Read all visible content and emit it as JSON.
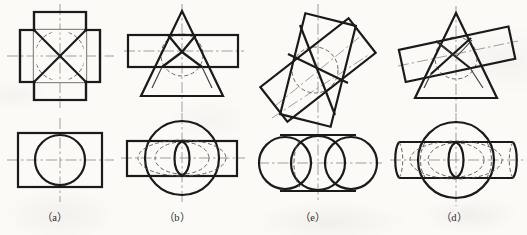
{
  "figure": {
    "kind": "engineering-drawing-plate",
    "background_color": "#fbfaf7",
    "line_color": "#1a1a1a",
    "hidden_line_color": "#4d4d4d",
    "center_line_color": "#8c8c8c",
    "outline_width_px": 2.2,
    "thin_width_px": 1.0,
    "labels": [
      {
        "id": "a",
        "text": "（a）",
        "x": 55,
        "y": 212
      },
      {
        "id": "b",
        "text": "（b）",
        "x": 175,
        "y": 212
      },
      {
        "id": "c",
        "text": "（e）",
        "x": 305,
        "y": 212
      },
      {
        "id": "d",
        "text": "（d）",
        "x": 448,
        "y": 212
      }
    ],
    "groups": [
      {
        "id": "a",
        "label": "（a）",
        "front_view": {
          "shape": "cross-shaped-outline",
          "note": "square prism crossed by a second square prism, with X diagonals and a hidden circle (cylinder) inscribed",
          "center": [
            60,
            55
          ],
          "half_core": 26,
          "arm": 14,
          "hidden_circle_radius": 25
        },
        "top_view": {
          "shape": "rectangle-with-circle",
          "center": [
            60,
            160
          ],
          "rect_half_width": 43,
          "rect_half_height": 27,
          "circle_radius": 25
        }
      },
      {
        "id": "b",
        "label": "（b）",
        "front_view": {
          "shape": "triangle-with-horizontal-rectangle",
          "note": "cone (triangle) penetrated by a horizontal cylinder (rectangle); hidden circle shows cylinder bore; intersection curves drawn",
          "apex": [
            182,
            12
          ],
          "base_left": [
            143,
            96
          ],
          "base_right": [
            222,
            96
          ],
          "rect": {
            "x": 128,
            "y": 35,
            "w": 110,
            "h": 32
          },
          "hidden_circle_center": [
            182,
            55
          ],
          "hidden_circle_radius": 20
        },
        "top_view": {
          "shape": "circle-with-rectangle-and-hidden-ellipses",
          "center": [
            182,
            158
          ],
          "circle_radius": 37,
          "rect_half_width": 55,
          "rect_half_height": 17
        }
      },
      {
        "id": "c",
        "label": "（e）",
        "front_view": {
          "shape": "two-tilted-rectangles-crossing",
          "note": "two inclined prisms (rectangles) crossing; hidden circle arcs for bore; oblique center lines",
          "center": [
            318,
            70
          ],
          "rect1_angle_deg": -72,
          "rect2_angle_deg": -38,
          "hidden_circle_radius": 23
        },
        "top_view": {
          "shape": "horizontal-cylinder-with-three-circles",
          "center": [
            318,
            163
          ],
          "cyl_half_length": 53,
          "cyl_half_height": 28,
          "circle_radius": 26
        }
      },
      {
        "id": "d",
        "label": "（d）",
        "front_view": {
          "shape": "triangle-with-tilted-rectangle",
          "note": "cone (triangle) penetrated by an inclined cylinder (tilted rectangle); hidden intersection curves",
          "apex": [
            456,
            14
          ],
          "base_left": [
            417,
            98
          ],
          "base_right": [
            496,
            98
          ],
          "rect_angle_deg": -12,
          "hidden_circle_center": [
            456,
            58
          ],
          "hidden_circle_radius": 20
        },
        "top_view": {
          "shape": "circle-with-horizontal-cylinder-and-hidden-ellipses",
          "center": [
            456,
            160
          ],
          "circle_radius": 38,
          "cyl_half_length": 60,
          "cyl_half_height": 18
        }
      }
    ]
  }
}
